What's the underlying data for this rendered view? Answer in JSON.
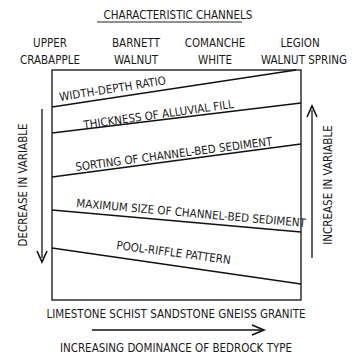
{
  "title": "CHARACTERISTIC CHANNELS",
  "channels": [
    {
      "line1": "UPPER",
      "line2": "CRABAPPLE"
    },
    {
      "line1": "BARNETT",
      "line2": "WALNUT"
    },
    {
      "line1": "COMANCHE",
      "line2": "WHITE"
    },
    {
      "line1": "LEGION",
      "line2": "WALNUT SPRING"
    }
  ],
  "variables": [
    "WIDTH-DEPTH RATIO",
    "THICKNESS OF ALLUVIAL FILL",
    "SORTING OF CHANNEL-BED SEDIMENT",
    "MAXIMUM SIZE OF CHANNEL-BED SEDIMENT",
    "POOL-RIFFLE PATTERN"
  ],
  "left_axis_label": "DECREASE IN VARIABLE",
  "right_axis_label": "INCREASE IN VARIABLE",
  "bedrock_types": "LIMESTONE SCHIST SANDSTONE GNEISS GRANITE",
  "bottom_axis_label": "INCREASING DOMINANCE OF BEDROCK TYPE"
}
